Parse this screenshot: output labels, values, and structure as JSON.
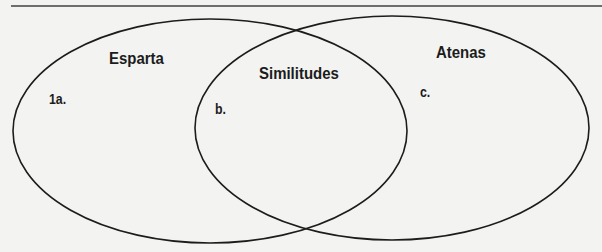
{
  "diagram": {
    "type": "venn",
    "sets": [
      {
        "name": "Esparta",
        "slot": "1a."
      },
      {
        "name": "Atenas",
        "slot": "c."
      }
    ],
    "intersection": {
      "name": "Similitudes",
      "slot": "b."
    }
  },
  "colors": {
    "background": "#f3f3f1",
    "outline": "#1c1c1c",
    "text": "#1c1c1c"
  }
}
